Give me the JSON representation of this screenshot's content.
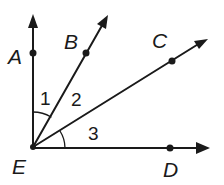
{
  "diagram": {
    "vertex": {
      "label": "E",
      "x": 33,
      "y": 147
    },
    "rays": [
      {
        "name": "EA",
        "end_label": "A",
        "point": {
          "x": 33,
          "y": 53
        },
        "arrow_tip": {
          "x": 33,
          "y": 16
        }
      },
      {
        "name": "EB",
        "end_label": "B",
        "point": {
          "x": 86,
          "y": 53
        },
        "arrow_tip": {
          "x": 107,
          "y": 17
        }
      },
      {
        "name": "EC",
        "end_label": "C",
        "point": {
          "x": 172,
          "y": 61
        },
        "arrow_tip": {
          "x": 206,
          "y": 40
        }
      },
      {
        "name": "ED",
        "end_label": "D",
        "point": {
          "x": 170,
          "y": 148
        },
        "arrow_tip": {
          "x": 208,
          "y": 148
        }
      }
    ],
    "angles": [
      {
        "label": "1",
        "between": [
          "EA",
          "EB"
        ]
      },
      {
        "label": "2",
        "between": [
          "EB",
          "EC"
        ]
      },
      {
        "label": "3",
        "between": [
          "EC",
          "ED"
        ]
      }
    ],
    "labels": {
      "A": "A",
      "B": "B",
      "C": "C",
      "D": "D",
      "E": "E",
      "angle1": "1",
      "angle2": "2",
      "angle3": "3"
    },
    "colors": {
      "ink": "#1a1a1a",
      "background": "#ffffff"
    }
  }
}
